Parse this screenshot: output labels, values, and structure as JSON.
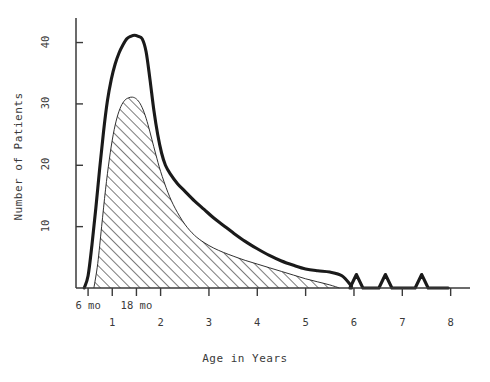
{
  "figure": {
    "kind": "scientific-line-chart",
    "background_color": "#ffffff",
    "ink_color": "#1a1a1a",
    "text_color": "#3a3a3a"
  },
  "chart_data": {
    "type": "area",
    "title": "",
    "subtitle": "",
    "xlabel": "Age in Years",
    "ylabel": "Number of Patients",
    "grid": false,
    "legend_position": "none",
    "xlim": [
      0.25,
      8.4
    ],
    "ylim": [
      0,
      44
    ],
    "x_tick_values": [
      0.5,
      1,
      1.5,
      2,
      3,
      4,
      5,
      6,
      7,
      8
    ],
    "x_tick_labels_upper": [
      "6 mo",
      "18 mo"
    ],
    "x_tick_labels_upper_values": [
      0.5,
      1.5
    ],
    "x_tick_labels_lower": [
      "1",
      "2",
      "3",
      "4",
      "5",
      "6",
      "7",
      "8"
    ],
    "x_tick_labels_lower_values": [
      1,
      2,
      3,
      4,
      5,
      6,
      7,
      8
    ],
    "y_tick_values": [
      10,
      20,
      30,
      40
    ],
    "y_tick_labels": [
      "10",
      "20",
      "30",
      "40"
    ],
    "series": [
      {
        "name": "Total patients (outer curve)",
        "style": "thick-solid-line",
        "fill": "none",
        "x": [
          0.42,
          0.5,
          0.58,
          0.66,
          0.74,
          0.82,
          0.9,
          0.98,
          1.06,
          1.14,
          1.22,
          1.3,
          1.38,
          1.46,
          1.54,
          1.62,
          1.7,
          1.78,
          1.86,
          1.94,
          2.02,
          2.1,
          2.2,
          2.35,
          2.5,
          2.7,
          2.9,
          3.1,
          3.3,
          3.5,
          3.75,
          4.0,
          4.25,
          4.5,
          4.75,
          5.0,
          5.25,
          5.5,
          5.75,
          5.95
        ],
        "y": [
          0.0,
          2.0,
          7.0,
          13.0,
          19.5,
          25.5,
          30.5,
          34.0,
          36.5,
          38.3,
          39.6,
          40.6,
          41.0,
          41.2,
          41.0,
          40.6,
          38.5,
          34.0,
          29.0,
          25.0,
          22.0,
          20.0,
          18.6,
          17.0,
          15.8,
          14.2,
          12.8,
          11.4,
          10.2,
          9.0,
          7.6,
          6.4,
          5.3,
          4.4,
          3.7,
          3.1,
          2.8,
          2.6,
          2.0,
          0.3
        ]
      },
      {
        "name": "Subgroup patients (hatched area)",
        "style": "hatched-45deg",
        "fill": "diagonal-hatch",
        "x": [
          0.62,
          0.7,
          0.78,
          0.86,
          0.94,
          1.02,
          1.1,
          1.18,
          1.26,
          1.34,
          1.42,
          1.5,
          1.58,
          1.66,
          1.74,
          1.82,
          1.9,
          2.0,
          2.15,
          2.3,
          2.5,
          2.7,
          2.9,
          3.1,
          3.3,
          3.5,
          3.75,
          4.0,
          4.25,
          4.5,
          4.75,
          5.0,
          5.25,
          5.5,
          5.7
        ],
        "y": [
          0.0,
          4.0,
          10.0,
          16.0,
          21.0,
          25.0,
          27.8,
          29.6,
          30.6,
          31.0,
          31.1,
          30.8,
          30.0,
          28.6,
          26.6,
          24.2,
          21.8,
          19.0,
          15.6,
          13.0,
          10.4,
          8.6,
          7.4,
          6.5,
          5.8,
          5.2,
          4.5,
          3.9,
          3.3,
          2.7,
          2.1,
          1.5,
          1.0,
          0.5,
          0.0
        ]
      }
    ],
    "annotations": [
      {
        "name": "late-bump-1",
        "x": 6.05,
        "height": 2.2,
        "shape": "small-triangular-peak"
      },
      {
        "name": "late-bump-2",
        "x": 6.65,
        "height": 2.2,
        "shape": "small-triangular-peak"
      },
      {
        "name": "late-bump-3",
        "x": 7.4,
        "height": 2.2,
        "shape": "small-triangular-peak"
      }
    ]
  }
}
